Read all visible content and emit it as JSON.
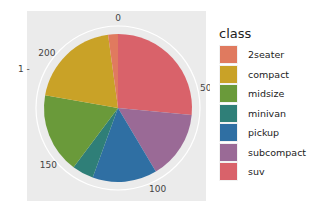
{
  "chart_data": {
    "type": "pie",
    "title": "",
    "xlabel": "",
    "ylabel": "",
    "y_tick_label": "1",
    "theta_ticks": [
      0,
      50,
      100,
      150,
      200
    ],
    "theta_max": 234,
    "legend_title": "class",
    "legend_position": "right",
    "categories": [
      "2seater",
      "compact",
      "midsize",
      "minivan",
      "pickup",
      "subcompact",
      "suv"
    ],
    "values": [
      5,
      47,
      41,
      11,
      33,
      35,
      62
    ],
    "colors": [
      "#E07A5F",
      "#C9A227",
      "#6A9A3A",
      "#2F7F78",
      "#2F6FA3",
      "#9A6A96",
      "#D9626A"
    ],
    "stack_order_clockwise_from_top": [
      "suv",
      "subcompact",
      "pickup",
      "minivan",
      "midsize",
      "compact",
      "2seater"
    ],
    "panel_background": "#EBEBEB",
    "grid": true
  },
  "legend": {
    "title": "class",
    "items": [
      {
        "label": "2seater",
        "color": "#E07A5F"
      },
      {
        "label": "compact",
        "color": "#C9A227"
      },
      {
        "label": "midsize",
        "color": "#6A9A3A"
      },
      {
        "label": "minivan",
        "color": "#2F7F78"
      },
      {
        "label": "pickup",
        "color": "#2F6FA3"
      },
      {
        "label": "subcompact",
        "color": "#9A6A96"
      },
      {
        "label": "suv",
        "color": "#D9626A"
      }
    ]
  }
}
